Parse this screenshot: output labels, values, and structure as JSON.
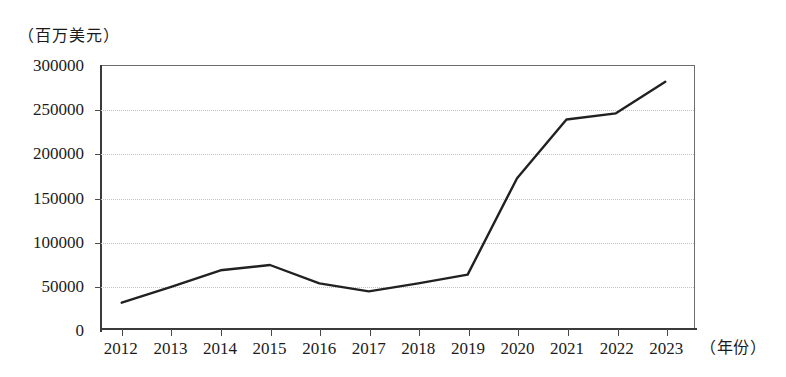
{
  "chart_data": {
    "type": "line",
    "title": "",
    "subtitle": "",
    "xlabel": "（年份）",
    "ylabel": "（百万美元）",
    "categories": [
      "2012",
      "2013",
      "2014",
      "2015",
      "2016",
      "2017",
      "2018",
      "2019",
      "2020",
      "2021",
      "2022",
      "2023"
    ],
    "series": [
      {
        "name": "金额",
        "values": [
          30000,
          48000,
          67000,
          73000,
          52000,
          43000,
          52000,
          62000,
          172000,
          239000,
          246000,
          282000
        ]
      }
    ],
    "ylim": [
      0,
      300000
    ],
    "yticks": [
      0,
      50000,
      100000,
      150000,
      200000,
      250000,
      300000
    ],
    "ytick_labels": [
      "0",
      "50000",
      "100000",
      "150000",
      "200000",
      "250000",
      "300000"
    ],
    "xtick_labels": [
      "2012",
      "2013",
      "2014",
      "2015",
      "2016",
      "2017",
      "2018",
      "2019",
      "2020",
      "2021",
      "2022",
      "2023"
    ],
    "grid": true,
    "grid_style": "dotted-horizontal",
    "legend": false,
    "legend_position": "none",
    "line_color": "#212121",
    "line_width": 2.4,
    "grid_color": "#c3c3c3",
    "axis_color": "#3a3a3a",
    "background": "#ffffff"
  },
  "axes": {
    "y_unit_caption": "（百万美元）",
    "x_unit_caption": "（年份）"
  }
}
